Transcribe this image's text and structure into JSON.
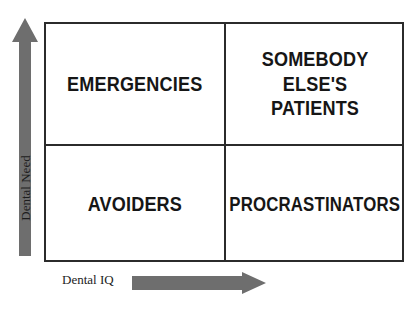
{
  "diagram": {
    "type": "2x2-quadrant-matrix",
    "axes": {
      "y": {
        "label": "Dental Need",
        "direction": "up",
        "arrow_icon": "arrow-up-icon",
        "color": "#6e6e6e"
      },
      "x": {
        "label": "Dental IQ",
        "direction": "right",
        "arrow_icon": "arrow-right-icon",
        "color": "#6e6e6e"
      }
    },
    "border_color": "#2b2b2b",
    "background_color": "#ffffff",
    "text_color": "#161616",
    "quadrants": [
      {
        "position": "top-left",
        "label": "EMERGENCIES",
        "dental_need": "high",
        "dental_iq": "low"
      },
      {
        "position": "top-right",
        "label": "SOMEBODY\nELSE'S\nPATIENTS",
        "dental_need": "high",
        "dental_iq": "high"
      },
      {
        "position": "bottom-left",
        "label": "AVOIDERS",
        "dental_need": "low",
        "dental_iq": "low"
      },
      {
        "position": "bottom-right",
        "label": "PROCRASTINATORS",
        "dental_need": "low",
        "dental_iq": "high"
      }
    ]
  }
}
